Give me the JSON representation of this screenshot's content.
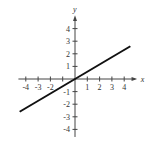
{
  "chart_data": {
    "type": "line",
    "title": "",
    "xlabel": "x",
    "ylabel": "y",
    "xlim": [
      -4.5,
      4.5
    ],
    "ylim": [
      -4.5,
      4.5
    ],
    "x_ticks": [
      -4,
      -3,
      -2,
      -1,
      1,
      2,
      3,
      4
    ],
    "x_tick_labels": [
      "-4",
      "-3",
      "-2",
      "",
      "1",
      "2",
      "3",
      "4"
    ],
    "y_ticks": [
      4,
      3,
      2,
      1,
      -1,
      -2,
      -3,
      -4
    ],
    "y_tick_labels": [
      "4",
      "3",
      "2",
      "1",
      "-1",
      "-2",
      "-3",
      "-4"
    ],
    "grid": false,
    "series": [
      {
        "name": "line",
        "x": [
          -4.5,
          4.5
        ],
        "y": [
          -2.6,
          2.6
        ],
        "color": "#111111"
      }
    ]
  },
  "colors": {
    "axis": "#444444",
    "line": "#111111"
  }
}
